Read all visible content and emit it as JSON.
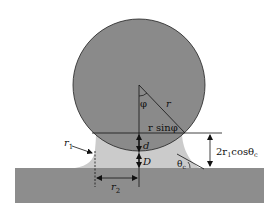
{
  "diagram": {
    "colors": {
      "sphere": "#8a8a8a",
      "meniscus": "#cbcbcb",
      "substrate": "#8d8d8d",
      "line": "#111111"
    },
    "labels": {
      "phi": "φ",
      "r": "r",
      "r_sin_phi": "r sinφ",
      "d": "d",
      "D": "D",
      "r1": "r",
      "r1_sub": "1",
      "r2": "r",
      "r2_sub": "2",
      "theta_c": "θ",
      "theta_c_sub": "c",
      "height_prefix": "2r",
      "height_sub1": "1",
      "height_mid": "cosθ",
      "height_sub2": "c"
    }
  }
}
